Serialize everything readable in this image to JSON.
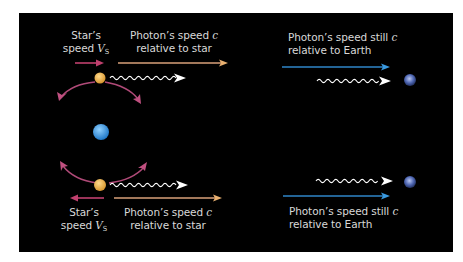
{
  "diagram": {
    "background": "#000000",
    "colors": {
      "star_velocity_arrow": "#c0406e",
      "orbit_arrow": "#b04a78",
      "photon_rel_star_arrow": "#d9a07a",
      "photon_rel_earth_arrow": "#2f86c9",
      "photon_wave": "#ffffff",
      "star": "#e8aa48",
      "planet": "#3a9be0",
      "earth": "#5a6fb8"
    },
    "top": {
      "star_speed_label": {
        "line1": "Star’s",
        "line2_prefix": "speed ",
        "symbol": "V",
        "subscript": "S"
      },
      "photon_star_label": {
        "line1_prefix": "Photon’s speed ",
        "symbol": "c",
        "line2": "relative to star"
      },
      "photon_earth_label": {
        "line1_prefix": "Photon’s speed still ",
        "symbol": "c",
        "line2": "relative to Earth"
      },
      "star_direction": "right"
    },
    "bottom": {
      "star_speed_label": {
        "line1": "Star’s",
        "line2_prefix": "speed ",
        "symbol": "V",
        "subscript": "S"
      },
      "photon_star_label": {
        "line1_prefix": "Photon’s speed ",
        "symbol": "c",
        "line2": "relative to star"
      },
      "photon_earth_label": {
        "line1_prefix": "Photon’s speed still ",
        "symbol": "c",
        "line2": "relative to Earth"
      },
      "star_direction": "left"
    },
    "objects": [
      "star-top",
      "planet",
      "star-bottom",
      "earth-top",
      "earth-bottom",
      "photon-wave-top-star",
      "photon-wave-top-earth",
      "photon-wave-bottom-star",
      "photon-wave-bottom-earth"
    ]
  }
}
